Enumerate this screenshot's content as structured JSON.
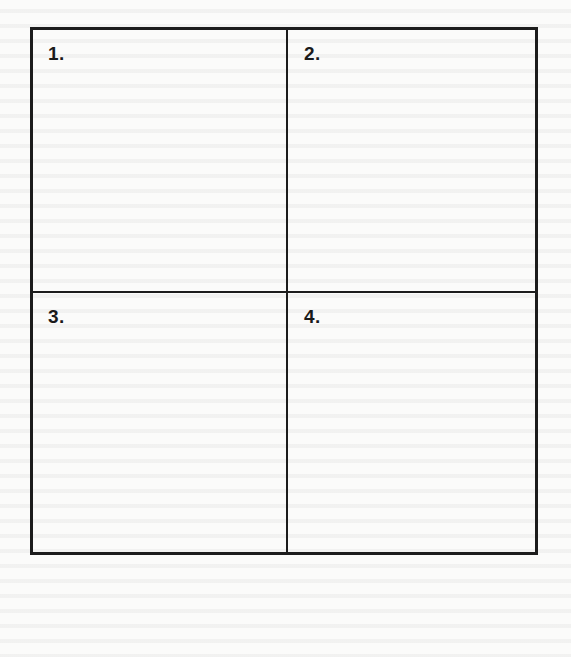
{
  "worksheet": {
    "grid": {
      "rows": 2,
      "columns": 2,
      "border_color": "#1c1c1c",
      "cells": [
        {
          "label": "1."
        },
        {
          "label": "2."
        },
        {
          "label": "3."
        },
        {
          "label": "4."
        }
      ]
    }
  }
}
